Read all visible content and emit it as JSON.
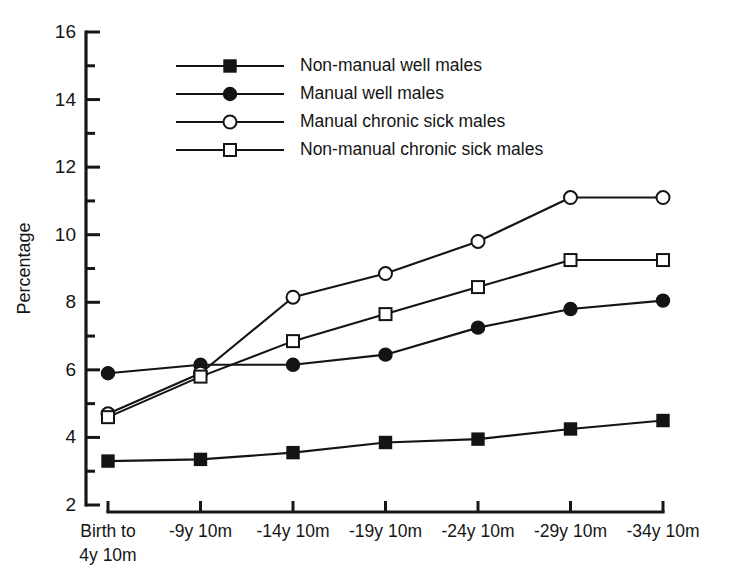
{
  "chart_data": {
    "type": "line",
    "title": "",
    "xlabel": "",
    "ylabel": "Percentage",
    "ylim": [
      2,
      16
    ],
    "ytick_step": 2,
    "yticks": [
      2,
      4,
      6,
      8,
      10,
      12,
      14,
      16
    ],
    "ytick_labels": [
      "2",
      "4",
      "6",
      "8",
      "10",
      "12",
      "14",
      "16"
    ],
    "yminor_ticks": [
      3,
      5,
      7,
      9,
      11,
      13,
      15
    ],
    "grid": false,
    "legend_position": "upper-left-inside",
    "categories": [
      "Birth to 4y 10m",
      "-9y 10m",
      "-14y 10m",
      "-19y 10m",
      "-24y 10m",
      "-29y 10m",
      "-34y 10m"
    ],
    "category_lines": [
      [
        "Birth to",
        "4y 10m"
      ],
      [
        "-9y 10m"
      ],
      [
        "-14y 10m"
      ],
      [
        "-19y 10m"
      ],
      [
        "-24y 10m"
      ],
      [
        "-29y 10m"
      ],
      [
        "-34y 10m"
      ]
    ],
    "series": [
      {
        "name": "Non-manual well males",
        "marker": "filled-square",
        "color": "#141414",
        "values": [
          3.3,
          3.35,
          3.55,
          3.85,
          3.95,
          4.25,
          4.5
        ]
      },
      {
        "name": "Manual well males",
        "marker": "filled-circle",
        "color": "#141414",
        "values": [
          5.9,
          6.15,
          6.15,
          6.45,
          7.25,
          7.8,
          8.05
        ]
      },
      {
        "name": "Manual chronic sick males",
        "marker": "open-circle",
        "color": "#141414",
        "values": [
          4.7,
          5.9,
          8.15,
          8.85,
          9.8,
          11.1,
          11.1
        ]
      },
      {
        "name": "Non-manual chronic sick males",
        "marker": "open-square",
        "color": "#141414",
        "values": [
          4.6,
          5.8,
          6.85,
          7.65,
          8.45,
          9.25,
          9.25
        ]
      }
    ]
  },
  "legend": {
    "items": [
      {
        "label": "Non-manual well males",
        "marker": "filled-square"
      },
      {
        "label": "Manual well males",
        "marker": "filled-circle"
      },
      {
        "label": "Manual chronic sick males",
        "marker": "open-circle"
      },
      {
        "label": "Non-manual chronic sick males",
        "marker": "open-square"
      }
    ]
  }
}
